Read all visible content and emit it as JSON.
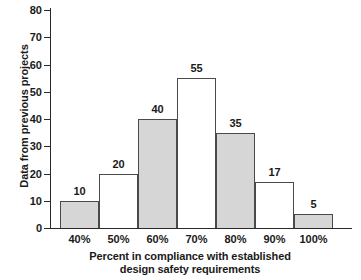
{
  "chart_data": {
    "type": "bar",
    "title": "",
    "subtitle": "",
    "xlabel_line1": "Percent in compliance with established",
    "xlabel_line2": "design safety requirements",
    "ylabel": "Data from previous projects",
    "categories": [
      "40%",
      "50%",
      "60%",
      "70%",
      "80%",
      "90%",
      "100%"
    ],
    "values": [
      10,
      20,
      40,
      55,
      35,
      17,
      5
    ],
    "data_labels": [
      "10",
      "20",
      "40",
      "55",
      "35",
      "17",
      "5"
    ],
    "bar_styles": [
      "filled",
      "open",
      "filled",
      "open",
      "filled",
      "open",
      "filled"
    ],
    "ylim": [
      0,
      80
    ],
    "ytick_values": [
      0,
      10,
      20,
      30,
      40,
      50,
      60,
      70,
      80
    ],
    "ytick_labels": [
      "0",
      "10",
      "20",
      "30",
      "40",
      "50",
      "60",
      "70",
      "80"
    ],
    "grid": false,
    "legend": false,
    "legend_position": "none",
    "colors": {
      "bar_fill": "#d6d6d6",
      "bar_open_fill": "#ffffff",
      "bar_edge": "#4a4a4a",
      "axis": "#2b2b2b",
      "text": "#1a1a1a",
      "background": "#ffffff"
    }
  }
}
